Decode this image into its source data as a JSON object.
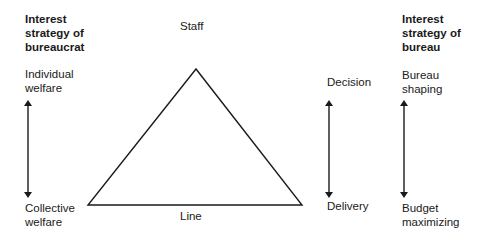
{
  "left": {
    "heading": "Interest\nstrategy of\nbureaucrat",
    "top_label": "Individual\nwelfare",
    "bottom_label": "Collective\nwelfare"
  },
  "triangle": {
    "apex_label": "Staff",
    "base_label": "Line"
  },
  "middle_right": {
    "top_label": "Decision",
    "bottom_label": "Delivery"
  },
  "right": {
    "heading": "Interest\nstrategy of\nbureau",
    "top_label": "Bureau\nshaping",
    "bottom_label": "Budget\nmaximizing"
  },
  "colors": {
    "stroke": "#1a1a1a",
    "background": "#ffffff"
  }
}
